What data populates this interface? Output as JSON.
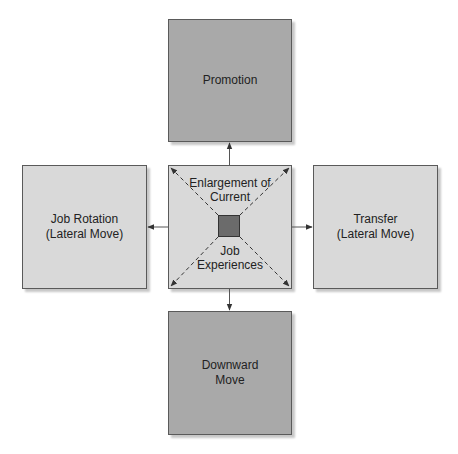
{
  "diagram": {
    "type": "career-development-directions",
    "colors": {
      "dark_box": "#a9a9a9",
      "light_box": "#d9d9d9",
      "core_square": "#6b6b6b",
      "border": "#5a5a5a",
      "arrow": "#333333"
    },
    "nodes": {
      "promotion": {
        "label": "Promotion",
        "position": "top",
        "shade": "dark"
      },
      "job_rotation": {
        "label": "Job Rotation\n(Lateral Move)",
        "position": "left",
        "shade": "light"
      },
      "transfer": {
        "label": "Transfer\n(Lateral Move)",
        "position": "right",
        "shade": "light"
      },
      "downward_move": {
        "label": "Downward\nMove",
        "position": "bottom",
        "shade": "dark"
      },
      "center": {
        "top_label": "Enlargement of\nCurrent",
        "bottom_label": "Job\nExperiences",
        "shade": "light"
      }
    },
    "edges": [
      {
        "from": "center",
        "to": "promotion",
        "style": "solid-arrow"
      },
      {
        "from": "center",
        "to": "job_rotation",
        "style": "solid-arrow"
      },
      {
        "from": "center",
        "to": "transfer",
        "style": "solid-arrow"
      },
      {
        "from": "center",
        "to": "downward_move",
        "style": "solid-arrow"
      },
      {
        "from": "core",
        "to": "center-corners",
        "style": "dashed-arrow",
        "count": 4
      }
    ]
  }
}
